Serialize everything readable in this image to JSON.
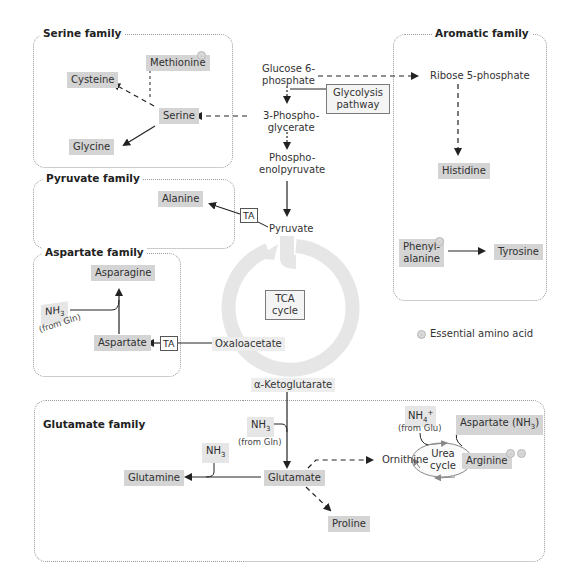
{
  "families": {
    "serine": {
      "title": "Serine family",
      "members": [
        "Methionine",
        "Cysteine",
        "Serine",
        "Glycine"
      ]
    },
    "pyruvate": {
      "title": "Pyruvate family",
      "members": [
        "Alanine"
      ]
    },
    "aspartate": {
      "title": "Aspartate family",
      "members": [
        "Asparagine",
        "Aspartate"
      ]
    },
    "aromatic": {
      "title": "Aromatic family",
      "members": [
        "Histidine",
        "Phenylalanine",
        "Tyrosine"
      ]
    },
    "glutamate": {
      "title": "Glutamate family",
      "members": [
        "Glutamine",
        "Glutamate",
        "Proline",
        "Ornithine",
        "Arginine"
      ]
    }
  },
  "amino_acids": {
    "methionine": "Methionine",
    "cysteine": "Cysteine",
    "serine": "Serine",
    "glycine": "Glycine",
    "alanine": "Alanine",
    "asparagine": "Asparagine",
    "aspartate": "Aspartate",
    "histidine": "Histidine",
    "phenylalanine_1": "Phenyl-",
    "phenylalanine_2": "alanine",
    "tyrosine": "Tyrosine",
    "glutamine": "Glutamine",
    "glutamate": "Glutamate",
    "proline": "Proline",
    "arginine": "Arginine",
    "aspartate_nh3": "Aspartate (NH",
    "aspartate_nh3_sub": "3",
    "aspartate_nh3_close": ")"
  },
  "metabolites": {
    "glucose6p_1": "Glucose 6-",
    "glucose6p_2": "phosphate",
    "pg3_1": "3-Phospho-",
    "pg3_2": "glycerate",
    "pep_1": "Phospho-",
    "pep_2": "enolpyruvate",
    "pyruvate": "Pyruvate",
    "ribose5p": "Ribose 5-phosphate",
    "oxaloacetate": "Oxaloacetate",
    "akg": "α-Ketoglutarate",
    "ornithine": "Ornithine"
  },
  "boxes": {
    "glycolysis_1": "Glycolysis",
    "glycolysis_2": "pathway",
    "tca_1": "TCA",
    "tca_2": "cycle",
    "urea_1": "Urea",
    "urea_2": "cycle",
    "ta": "TA"
  },
  "nitrogen": {
    "nh3": "NH",
    "sub3": "3",
    "nh4": "NH",
    "sub4": "4",
    "sup_plus": "+",
    "from_gln": "(from Gln)",
    "from_glu": "(from Glu)"
  },
  "legend": {
    "essential_label": "Essential amino acid"
  },
  "colors": {
    "amino_acid_fill": "#d4d4d4",
    "tca_ring": "#e6e6e6",
    "family_border": "#9a9a9a",
    "arrow": "#222222"
  }
}
